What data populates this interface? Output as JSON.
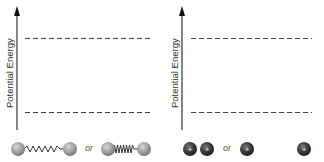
{
  "diagrams": [
    {
      "id": "left",
      "y_axis_label": "Potential Energy",
      "energy_levels": [
        "upper dashed level",
        "lower dashed level"
      ],
      "bottom_label_connector": "or",
      "options": [
        "two atoms joined by stretched spring",
        "two atoms joined by compressed spring"
      ]
    },
    {
      "id": "right",
      "y_axis_label": "Potential Energy",
      "energy_levels": [
        "upper dashed level",
        "lower dashed level"
      ],
      "bottom_label_connector": "or",
      "options": [
        "two positive charges close together",
        "two positive charges far apart"
      ],
      "charge_symbol": "+"
    }
  ],
  "colors": {
    "axis": "#333333",
    "dash": "#444444",
    "atom": "#9a9a9a",
    "charge": "#3a3a3a"
  }
}
